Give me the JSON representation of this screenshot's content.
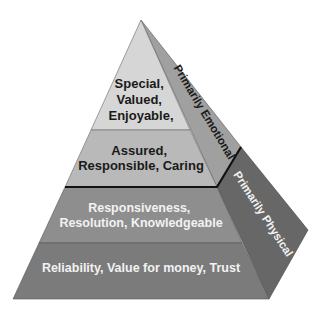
{
  "diagram": {
    "type": "pyramid",
    "colors": {
      "background": "#ffffff",
      "layer1_fill": "#d6d6d6",
      "layer2_fill": "#b9b9b9",
      "layer3_fill": "#8e8e8e",
      "layer4_fill": "#7b7b7b",
      "side_emotional_fill": "#a0a0a0",
      "side_physical_fill": "#676767",
      "dark_text": "#1a1a1a",
      "light_text": "#f2f2f2",
      "outline": "#222222"
    },
    "layers": [
      {
        "lines": [
          "Special,",
          "Valued,",
          "Enjoyable,"
        ]
      },
      {
        "lines": [
          "Assured,",
          "Responsible, Caring"
        ]
      },
      {
        "lines": [
          "Responsiveness,",
          "Resolution, Knowledgeable"
        ]
      },
      {
        "lines": [
          "Reliability, Value for money, Trust"
        ]
      }
    ],
    "side_labels": {
      "upper": "Primarily Emotional",
      "lower": "Primarily Physical"
    }
  }
}
